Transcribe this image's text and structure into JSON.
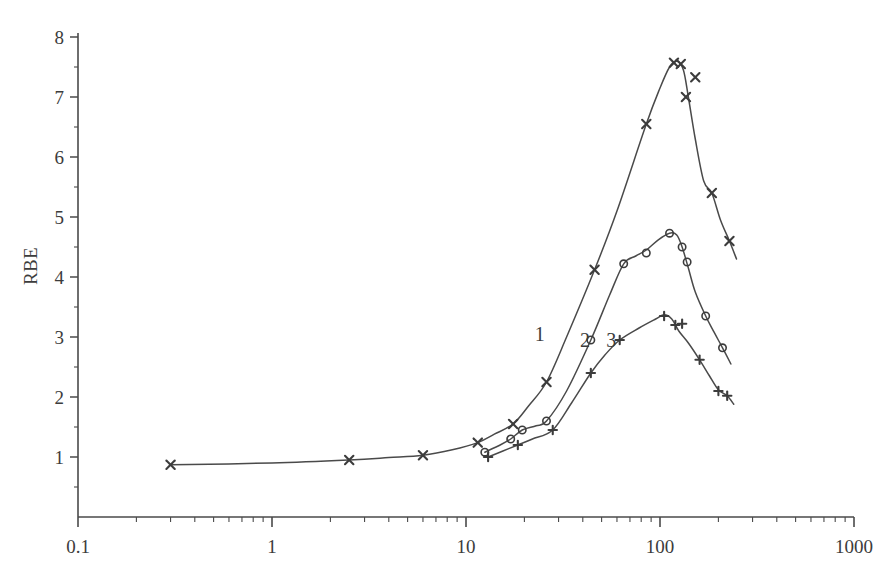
{
  "chart_data": {
    "type": "line",
    "title": "",
    "subtitle": "",
    "xlabel": "",
    "ylabel": "RBE",
    "xscale": "log",
    "yscale": "linear",
    "xlim": [
      0.1,
      1000
    ],
    "ylim": [
      0,
      8
    ],
    "grid": false,
    "legend_position": "inline-curve-labels",
    "xticks": [
      "0.1",
      "1",
      "10",
      "100",
      "1000"
    ],
    "xtick_values": [
      0.1,
      1,
      10,
      100,
      1000
    ],
    "yticks": [
      "1",
      "2",
      "3",
      "4",
      "5",
      "6",
      "7",
      "8"
    ],
    "ytick_values": [
      1,
      2,
      3,
      4,
      5,
      6,
      7,
      8
    ],
    "yminor_step": 0.5,
    "series": [
      {
        "name": "1",
        "marker": "x",
        "label": "1",
        "label_x": 24,
        "label_y": 3.05,
        "points": [
          {
            "x": 0.3,
            "y": 0.87
          },
          {
            "x": 2.5,
            "y": 0.95
          },
          {
            "x": 6.0,
            "y": 1.03
          },
          {
            "x": 11.5,
            "y": 1.24
          },
          {
            "x": 17.5,
            "y": 1.55
          },
          {
            "x": 26.0,
            "y": 2.25
          },
          {
            "x": 46.0,
            "y": 4.12
          },
          {
            "x": 85.0,
            "y": 6.55
          },
          {
            "x": 118.0,
            "y": 7.57
          },
          {
            "x": 128.0,
            "y": 7.55
          },
          {
            "x": 136.0,
            "y": 7.0
          },
          {
            "x": 152.0,
            "y": 7.33
          },
          {
            "x": 185.0,
            "y": 5.4
          },
          {
            "x": 228.0,
            "y": 4.6
          }
        ],
        "curve": [
          {
            "x": 0.3,
            "y": 0.87
          },
          {
            "x": 1.0,
            "y": 0.9
          },
          {
            "x": 2.5,
            "y": 0.95
          },
          {
            "x": 4.0,
            "y": 0.99
          },
          {
            "x": 6.0,
            "y": 1.03
          },
          {
            "x": 8.5,
            "y": 1.12
          },
          {
            "x": 11.5,
            "y": 1.24
          },
          {
            "x": 14.0,
            "y": 1.38
          },
          {
            "x": 17.5,
            "y": 1.55
          },
          {
            "x": 21.0,
            "y": 1.85
          },
          {
            "x": 26.0,
            "y": 2.25
          },
          {
            "x": 33.0,
            "y": 3.0
          },
          {
            "x": 46.0,
            "y": 4.12
          },
          {
            "x": 60.0,
            "y": 5.1
          },
          {
            "x": 85.0,
            "y": 6.55
          },
          {
            "x": 100.0,
            "y": 7.15
          },
          {
            "x": 112.0,
            "y": 7.5
          },
          {
            "x": 122.0,
            "y": 7.6
          },
          {
            "x": 132.0,
            "y": 7.45
          },
          {
            "x": 140.0,
            "y": 7.0
          },
          {
            "x": 152.0,
            "y": 6.3
          },
          {
            "x": 168.0,
            "y": 5.6
          },
          {
            "x": 185.0,
            "y": 5.4
          },
          {
            "x": 205.0,
            "y": 4.95
          },
          {
            "x": 228.0,
            "y": 4.6
          },
          {
            "x": 248.0,
            "y": 4.3
          }
        ]
      },
      {
        "name": "2",
        "marker": "o",
        "label": "2",
        "label_x": 41,
        "label_y": 2.95,
        "points": [
          {
            "x": 12.5,
            "y": 1.08
          },
          {
            "x": 17.0,
            "y": 1.3
          },
          {
            "x": 19.5,
            "y": 1.45
          },
          {
            "x": 26.0,
            "y": 1.6
          },
          {
            "x": 44.0,
            "y": 2.95
          },
          {
            "x": 65.0,
            "y": 4.22
          },
          {
            "x": 85.0,
            "y": 4.4
          },
          {
            "x": 112.0,
            "y": 4.73
          },
          {
            "x": 130.0,
            "y": 4.5
          },
          {
            "x": 138.0,
            "y": 4.25
          },
          {
            "x": 172.0,
            "y": 3.35
          },
          {
            "x": 210.0,
            "y": 2.82
          }
        ],
        "curve": [
          {
            "x": 12.5,
            "y": 1.08
          },
          {
            "x": 15.0,
            "y": 1.2
          },
          {
            "x": 17.0,
            "y": 1.3
          },
          {
            "x": 19.5,
            "y": 1.45
          },
          {
            "x": 23.0,
            "y": 1.52
          },
          {
            "x": 26.0,
            "y": 1.6
          },
          {
            "x": 33.0,
            "y": 2.1
          },
          {
            "x": 44.0,
            "y": 2.95
          },
          {
            "x": 55.0,
            "y": 3.7
          },
          {
            "x": 65.0,
            "y": 4.22
          },
          {
            "x": 75.0,
            "y": 4.35
          },
          {
            "x": 85.0,
            "y": 4.45
          },
          {
            "x": 98.0,
            "y": 4.62
          },
          {
            "x": 112.0,
            "y": 4.73
          },
          {
            "x": 122.0,
            "y": 4.7
          },
          {
            "x": 130.0,
            "y": 4.5
          },
          {
            "x": 140.0,
            "y": 4.15
          },
          {
            "x": 152.0,
            "y": 3.75
          },
          {
            "x": 172.0,
            "y": 3.35
          },
          {
            "x": 190.0,
            "y": 3.08
          },
          {
            "x": 210.0,
            "y": 2.82
          },
          {
            "x": 232.0,
            "y": 2.55
          }
        ]
      },
      {
        "name": "3",
        "marker": "+",
        "label": "3",
        "label_x": 56,
        "label_y": 2.95,
        "points": [
          {
            "x": 13.0,
            "y": 1.0
          },
          {
            "x": 18.5,
            "y": 1.2
          },
          {
            "x": 28.0,
            "y": 1.45
          },
          {
            "x": 44.0,
            "y": 2.4
          },
          {
            "x": 62.0,
            "y": 2.95
          },
          {
            "x": 105.0,
            "y": 3.35
          },
          {
            "x": 120.0,
            "y": 3.2
          },
          {
            "x": 130.0,
            "y": 3.22
          },
          {
            "x": 160.0,
            "y": 2.62
          },
          {
            "x": 200.0,
            "y": 2.1
          },
          {
            "x": 222.0,
            "y": 2.02
          }
        ],
        "curve": [
          {
            "x": 13.0,
            "y": 1.0
          },
          {
            "x": 15.5,
            "y": 1.1
          },
          {
            "x": 18.5,
            "y": 1.2
          },
          {
            "x": 22.0,
            "y": 1.3
          },
          {
            "x": 28.0,
            "y": 1.45
          },
          {
            "x": 35.0,
            "y": 1.9
          },
          {
            "x": 44.0,
            "y": 2.4
          },
          {
            "x": 52.0,
            "y": 2.7
          },
          {
            "x": 62.0,
            "y": 2.95
          },
          {
            "x": 78.0,
            "y": 3.15
          },
          {
            "x": 95.0,
            "y": 3.3
          },
          {
            "x": 105.0,
            "y": 3.37
          },
          {
            "x": 115.0,
            "y": 3.3
          },
          {
            "x": 125.0,
            "y": 3.1
          },
          {
            "x": 140.0,
            "y": 2.9
          },
          {
            "x": 160.0,
            "y": 2.62
          },
          {
            "x": 180.0,
            "y": 2.35
          },
          {
            "x": 200.0,
            "y": 2.12
          },
          {
            "x": 222.0,
            "y": 2.02
          },
          {
            "x": 240.0,
            "y": 1.88
          }
        ]
      }
    ],
    "colors": {
      "axis": "#4a4a4a",
      "curve": "#4a4a4a",
      "marker": "#3c3c3c",
      "background": "#ffffff"
    }
  }
}
